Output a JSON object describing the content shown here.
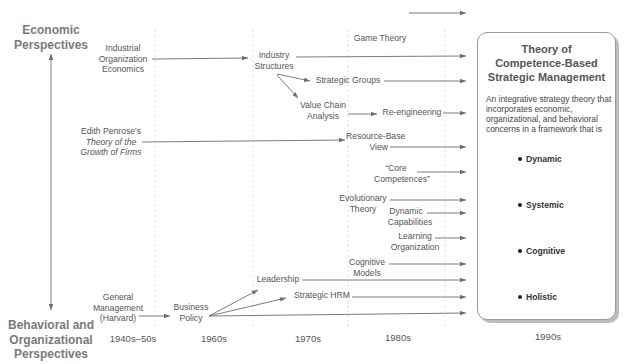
{
  "axis": {
    "top_label_line1": "Economic",
    "top_label_line2": "Perspectives",
    "bottom_label_line1": "Behavioral and",
    "bottom_label_line2": "Organizational",
    "bottom_label_line3": "Perspectives"
  },
  "eras": [
    "1940s–50s",
    "1960s",
    "1970s",
    "1980s",
    "1990s"
  ],
  "nodes": {
    "io_econ": [
      "Industrial",
      "Organization",
      "Economics"
    ],
    "penrose": [
      "Edith Penrose's",
      "Theory of the",
      "Growth of Firms"
    ],
    "general_mgmt": [
      "General",
      "Management",
      "(Harvard)"
    ],
    "business_policy": [
      "Business",
      "Policy"
    ],
    "industry_structures": [
      "Industry",
      "Structures"
    ],
    "game_theory": "Game Theory",
    "strategic_groups": "Strategic Groups",
    "value_chain": [
      "Value Chain",
      "Analysis"
    ],
    "reengineering": "Re-engineering",
    "resource_base": [
      "Resource-Base",
      "View"
    ],
    "core_comp": [
      "“Core",
      "Competences”"
    ],
    "evolutionary": [
      "Evolutionary",
      "Theory"
    ],
    "dynamic_cap": [
      "Dynamic",
      "Capabilities"
    ],
    "learning_org": [
      "Learning",
      "Organization"
    ],
    "cognitive_models": [
      "Cognitive",
      "Models"
    ],
    "leadership": "Leadership",
    "strategic_hrm": "Strategic HRM"
  },
  "target_box": {
    "title_line1": "Theory of",
    "title_line2": "Competence-Based",
    "title_line3": "Strategic Management",
    "body": "An integrative strategy theory that incorporates economic, organizational, and behavioral concerns in a framework that is",
    "traits": [
      "Dynamic",
      "Systemic",
      "Cognitive",
      "Holistic"
    ]
  },
  "colors": {
    "line": "#6e6e6e",
    "text": "#555555",
    "axis_text": "#7a7a7a",
    "divider": "#d8d8d8"
  }
}
